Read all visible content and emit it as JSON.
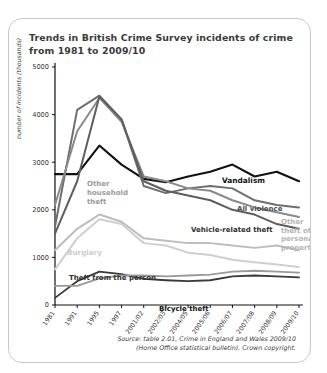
{
  "card": {
    "title": "Trends in British Crime Survey incidents of crime from 1981 to 2009/10",
    "source_line1": "Source: table 2.01, Crime in England and Wales 2009/10",
    "source_line2": "(Home Office statistical bulletin). Crown copyright."
  },
  "chart_data": {
    "type": "line",
    "title": "Trends in British Crime Survey incidents of crime from 1981 to 2009/10",
    "xlabel": "",
    "ylabel": "number of incidents (thousands)",
    "ylim": [
      0,
      5000
    ],
    "yticks": [
      0,
      1000,
      2000,
      3000,
      4000,
      5000
    ],
    "grid": false,
    "legend_position": "inline-annotations",
    "categories": [
      "1981",
      "1991",
      "1995",
      "1997",
      "2001/02",
      "2002/03",
      "2004/05",
      "2005/06",
      "2006/07",
      "2007/08",
      "2008/09",
      "2009/10"
    ],
    "series": [
      {
        "name": "Vandalism",
        "color": "#111111",
        "width": 2.1,
        "values": [
          2750,
          2750,
          3350,
          2950,
          2650,
          2580,
          2700,
          2800,
          2950,
          2700,
          2800,
          2600
        ]
      },
      {
        "name": "All violence",
        "color": "#6e6e6e",
        "width": 2.0,
        "values": [
          1650,
          4100,
          4400,
          3900,
          2500,
          2350,
          2450,
          2500,
          2450,
          2200,
          2100,
          2050
        ]
      },
      {
        "name": "Other household theft",
        "color": "#8a8a8a",
        "width": 2.0,
        "values": [
          2100,
          3650,
          4350,
          3850,
          2700,
          2600,
          2450,
          2400,
          2200,
          2050,
          1950,
          1850
        ]
      },
      {
        "name": "Vehicle-related theft",
        "color": "#5e5e5e",
        "width": 2.0,
        "values": [
          1500,
          2600,
          4380,
          3900,
          2600,
          2400,
          2300,
          2200,
          2000,
          1900,
          1700,
          1600
        ]
      },
      {
        "name": "Burglary",
        "color": "#cfcfcf",
        "width": 2.0,
        "values": [
          750,
          1400,
          1800,
          1700,
          1300,
          1250,
          1100,
          1050,
          950,
          900,
          850,
          800
        ]
      },
      {
        "name": "Other theft of personal property",
        "color": "#bdbdbd",
        "width": 2.0,
        "values": [
          1150,
          1600,
          1900,
          1750,
          1400,
          1350,
          1300,
          1300,
          1250,
          1200,
          1250,
          1150
        ]
      },
      {
        "name": "Theft from the person",
        "color": "#3a3a3a",
        "width": 1.8,
        "values": [
          150,
          500,
          700,
          650,
          550,
          520,
          500,
          520,
          600,
          620,
          600,
          580
        ]
      },
      {
        "name": "Bicycle theft",
        "color": "#9a9a9a",
        "width": 1.8,
        "values": [
          400,
          400,
          560,
          620,
          620,
          600,
          620,
          640,
          700,
          720,
          700,
          680
        ]
      }
    ],
    "annotations": [
      {
        "text": "Vandalism",
        "color": "#111111",
        "size": 7.4
      },
      {
        "text": "All violence",
        "color": "#4a4a4a",
        "size": 7.0
      },
      {
        "text": "Other household theft",
        "color": "#9a9a9a",
        "size": 7.0
      },
      {
        "text": "Vehicle-related theft",
        "color": "#2f2f2f",
        "size": 7.0
      },
      {
        "text": "Burglary",
        "color": "#cdcdcd",
        "size": 7.2
      },
      {
        "text": "Other theft of personal property",
        "color": "#b4b4b4",
        "size": 7.0
      },
      {
        "text": "Theft from the person",
        "color": "#2f2f2f",
        "size": 7.0
      },
      {
        "text": "Bicycle theft",
        "color": "#111111",
        "size": 7.0
      }
    ]
  }
}
